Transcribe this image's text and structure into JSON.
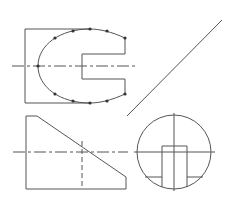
{
  "diagram": {
    "type": "orthographic-projection",
    "colors": {
      "line": "#555555",
      "point": "#333333",
      "background": "#ffffff"
    },
    "views": {
      "top_view": {
        "description": "Rectangle with semicircular-ended profile and rectangular notch, marked construction points",
        "rectangle": {
          "x1": 25,
          "y1": 29,
          "x2": 90,
          "y2": 103
        },
        "notch": {
          "inner_x": 82,
          "outer_x": 125,
          "top_y": 54,
          "bottom_y": 79
        },
        "centerline": {
          "x1": 12,
          "x2": 137,
          "y": 66
        },
        "points": [
          [
            38,
            66
          ],
          [
            55,
            38
          ],
          [
            73,
            31
          ],
          [
            90,
            29
          ],
          [
            107,
            31
          ],
          [
            125,
            38
          ],
          [
            55,
            94
          ],
          [
            73,
            101
          ],
          [
            90,
            103
          ],
          [
            107,
            101
          ],
          [
            125,
            94
          ]
        ]
      },
      "miter_line": {
        "x1": 127,
        "y1": 116,
        "x2": 222,
        "y2": 20
      },
      "front_view": {
        "description": "Truncated wedge with chamfered top-left, hidden vertical line",
        "outline": [
          [
            26,
            116
          ],
          [
            37,
            116
          ],
          [
            126,
            177
          ],
          [
            126,
            189
          ],
          [
            26,
            189
          ]
        ],
        "centerline": {
          "x1": 13,
          "x2": 128,
          "y": 152
        },
        "hidden_line": {
          "x": 82,
          "y1": 141,
          "y2": 189
        }
      },
      "side_view": {
        "description": "Circle with inner rectangular slot and shelf lines",
        "circle": {
          "cx": 174,
          "cy": 152,
          "r": 37
        },
        "h_centerline": {
          "x1": 134,
          "x2": 215,
          "y": 152
        },
        "v_centerline": {
          "x": 174,
          "y1": 113,
          "y2": 191
        },
        "slot": {
          "x1": 162,
          "x2": 187,
          "y1": 146
        },
        "shelf_y": 177
      }
    }
  }
}
